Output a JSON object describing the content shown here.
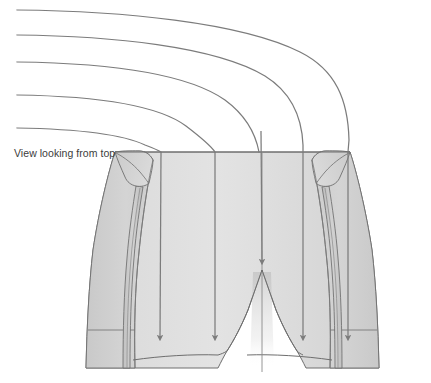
{
  "figure": {
    "caption": "View looking from top"
  },
  "colors": {
    "background": "#ffffff",
    "body_fill_light": "#e2e2e2",
    "body_fill_mid": "#d8d8d8",
    "body_fill_dark": "#cfcfcf",
    "side_panel_fill": "#cccccc",
    "roll_edge_fill": "#bdbdbd",
    "outline": "#6e6e6e",
    "seam_line": "#7a7a7a",
    "flow_line": "#7c7c7c",
    "caption_text": "#3c3c3c",
    "shadow": "#c9c9c9"
  },
  "geometry": {
    "width": 431,
    "height": 383,
    "waist_line_y": 152,
    "crotch_point": {
      "x": 262,
      "y": 270
    },
    "left_outer_top_x": 115,
    "right_outer_top_x": 350
  },
  "flow_lines": [
    {
      "name": "flow-line-1",
      "start": {
        "x": 17,
        "y": 10
      },
      "enters_waist_x": 348,
      "label": "outermost"
    },
    {
      "name": "flow-line-2",
      "start": {
        "x": 17,
        "y": 35
      },
      "enters_waist_x": 303,
      "label": "outer"
    },
    {
      "name": "flow-line-3",
      "start": {
        "x": 17,
        "y": 62
      },
      "enters_waist_x": 262,
      "label": "center"
    },
    {
      "name": "flow-line-4",
      "start": {
        "x": 17,
        "y": 95
      },
      "enters_waist_x": 215,
      "label": "inner"
    },
    {
      "name": "flow-line-5",
      "start": {
        "x": 17,
        "y": 128
      },
      "enters_waist_x": 160,
      "label": "innermost"
    }
  ],
  "arrows": [
    {
      "name": "arrow-left-outer",
      "x": 160,
      "tip_y": 345
    },
    {
      "name": "arrow-left-inner",
      "x": 215,
      "tip_y": 345
    },
    {
      "name": "arrow-center",
      "x": 262,
      "tip_y": 268
    },
    {
      "name": "arrow-right-inner",
      "x": 303,
      "tip_y": 345
    },
    {
      "name": "arrow-right-outer",
      "x": 348,
      "tip_y": 345
    }
  ],
  "parts": [
    {
      "name": "waistband-top-edge"
    },
    {
      "name": "left-side-panel"
    },
    {
      "name": "right-side-panel"
    },
    {
      "name": "left-roll-edge"
    },
    {
      "name": "right-roll-edge"
    },
    {
      "name": "left-leg-hem"
    },
    {
      "name": "right-leg-hem"
    },
    {
      "name": "center-front-seam"
    },
    {
      "name": "crotch-seam"
    }
  ]
}
